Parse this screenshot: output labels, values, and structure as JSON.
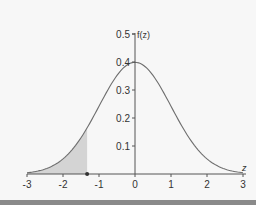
{
  "chart_data": {
    "type": "area",
    "title": "",
    "xlabel": "z",
    "ylabel": "f(z)",
    "xlim": [
      -3,
      3
    ],
    "ylim": [
      0,
      0.5
    ],
    "x_ticks": [
      -3,
      -2,
      -1,
      0,
      1,
      2,
      3
    ],
    "x_tick_labels": [
      "-3",
      "-2",
      "-1",
      "0",
      "1",
      "2",
      "3"
    ],
    "y_ticks": [
      0.1,
      0.2,
      0.3,
      0.4,
      0.5
    ],
    "y_tick_labels": [
      "0.1",
      "0.2",
      "0.3",
      "0.4",
      "0.5"
    ],
    "grid": false,
    "legend": null,
    "series": [
      {
        "name": "f(z)",
        "function": "standard normal pdf",
        "x": [
          -3,
          -2.5,
          -2,
          -1.5,
          -1,
          -0.5,
          0,
          0.5,
          1,
          1.5,
          2,
          2.5,
          3
        ],
        "values": [
          0.004,
          0.018,
          0.054,
          0.13,
          0.242,
          0.352,
          0.399,
          0.352,
          0.242,
          0.13,
          0.054,
          0.018,
          0.004
        ]
      }
    ],
    "shaded_region": {
      "from": -3,
      "to": -1.33,
      "color": "#d4d4d4"
    },
    "marker": {
      "x": -1.33,
      "y": 0
    },
    "colors": {
      "curve": "#6e6e6e",
      "axis": "#555555",
      "shade": "#d4d4d4"
    }
  },
  "labels": {
    "y_axis_title": "f(z)",
    "x_axis_title": "z",
    "x_ticks": [
      "-3",
      "-2",
      "-1",
      "0",
      "1",
      "2",
      "3"
    ],
    "y_ticks": [
      "0.1",
      "0.2",
      "0.3",
      "0.4",
      "0.5"
    ]
  }
}
